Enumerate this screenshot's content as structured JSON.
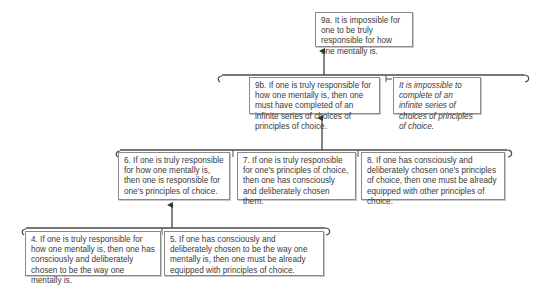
{
  "diagram": {
    "type": "argument-tree",
    "nodes": [
      {
        "id": "9a",
        "text": "9a. It is impossible for one to be truly responsible for how one mentally is.",
        "italic": false
      },
      {
        "id": "9b",
        "text": "9b. If one is truly responsible for how one mentally is, then one must have completed of an infinite series of choices of principles of choice.",
        "italic": false
      },
      {
        "id": "9b-support",
        "text": "It is impossible to complete of an infinite series of choices of principles of choice.",
        "italic": true
      },
      {
        "id": "6",
        "text": "6. If one is truly responsible for how one mentally is, then one is responsible for one's principles of choice.",
        "italic": false
      },
      {
        "id": "7",
        "text": "7. If one is truly responsible for one's principles of choice, then one has consciously and deliberately chosen them.",
        "italic": false
      },
      {
        "id": "8",
        "text": "8. If one has consciously and deliberately chosen one's principles of choice, then one must be already equipped with other principles of choice.",
        "italic": false
      },
      {
        "id": "4",
        "text": "4. If one is truly responsible for how one mentally is, then one has consciously and deliberately chosen to be the way one mentally is.",
        "italic": false
      },
      {
        "id": "5",
        "text": "5. If one has consciously and deliberately chosen to be the way one mentally is, then one must be already equipped with principles of choice.",
        "italic": false
      }
    ],
    "edges": [
      {
        "from_group": [
          "9b",
          "9b-support"
        ],
        "to": "9a"
      },
      {
        "from_group": [
          "6",
          "7",
          "8"
        ],
        "to": "9b"
      },
      {
        "from_group": [
          "4",
          "5"
        ],
        "to": "6"
      }
    ],
    "colors": {
      "line": "#4a4a4a",
      "border": "#8a8a8a",
      "text": "#3a3a3a"
    }
  }
}
